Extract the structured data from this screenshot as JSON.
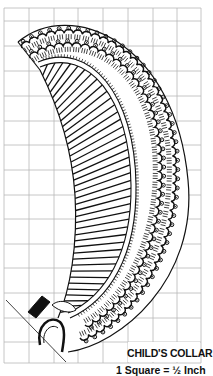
{
  "figure": {
    "title": "CHILD'S COLLAR",
    "scale_note": "1 Square = ½ Inch",
    "colors": {
      "ink": "#111111",
      "grid": "#b8b8b8",
      "background": "#ffffff"
    }
  },
  "grid": {
    "left": 4,
    "top": 8,
    "right": 201,
    "bottom": 363,
    "col_lines": [
      4,
      29,
      54,
      78,
      103,
      128,
      153,
      177,
      201
    ],
    "row_lines": [
      8,
      21,
      46,
      71,
      96,
      121,
      145,
      170,
      195,
      219,
      244,
      268,
      293,
      318,
      342,
      363
    ]
  },
  "collar": {
    "outer_edge": "M18 42 C70 -2 175 40 188 180 C198 280 120 345 68 352",
    "scallop_edges": [
      "M22 48 C75 10 160 45 172 150 C180 250 130 320 80 338",
      "M30 58 C80 25 150 60 158 150 C165 240 125 305 85 325"
    ],
    "neck_edge": "M38 62 C90 40 135 95 136 185 C137 255 110 300 70 318",
    "neck_edge_inner": "M40 67 C88 47 130 98 131 185 C132 252 106 296 68 313",
    "stripe_inner_edge": "M40 70 C60 110 72 150 75 195 C78 245 70 290 58 318"
  }
}
